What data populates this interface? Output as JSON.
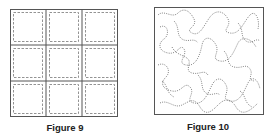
{
  "figures": [
    {
      "id": "figure-9",
      "caption": "Figure 9",
      "description": "3x3 grid of squares with dashed inner quilting lines"
    },
    {
      "id": "figure-10",
      "caption": "Figure 10",
      "description": "square with meandering stipple dotted pattern"
    }
  ],
  "colors": {
    "border": "#555555",
    "dash": "#777777"
  }
}
